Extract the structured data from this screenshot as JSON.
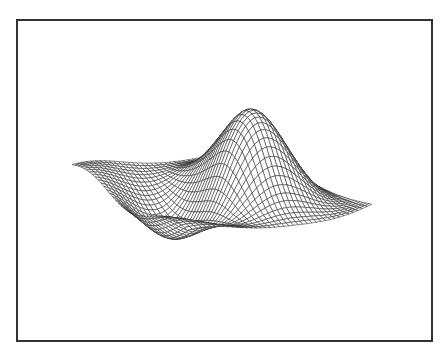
{
  "chart_data": {
    "type": "surface",
    "title": "",
    "xlabel": "",
    "ylabel": "",
    "zlabel": "",
    "axes_visible": false,
    "grid": false,
    "legend": null,
    "render_style": "wireframe-hidden-line",
    "surface": {
      "description": "Damped radial/sinusoidal wave surface z = f(x,y), peaks and troughs alternating",
      "grid_size": [
        40,
        40
      ],
      "x_range": [
        -3.0,
        3.0
      ],
      "y_range": [
        -3.0,
        3.0
      ],
      "function_terms": [
        {
          "kind": "sin_x",
          "amp": 0.9,
          "freq": 1.35,
          "phase": 0.3
        },
        {
          "kind": "cos_y",
          "amp": 0.7,
          "freq": 1.1,
          "phase": 0.0
        },
        {
          "kind": "gauss",
          "amp": 1.1,
          "cx": 0.3,
          "cy": 0.9,
          "s": 0.9
        }
      ],
      "envelope_decay": 0.17
    },
    "view": {
      "azimuth_deg": -32,
      "elevation_deg": 28,
      "screen_center": [
        222,
        188
      ],
      "scale_xy": 25,
      "scale_z": 40
    },
    "colors": {
      "line": "#2a2a2a",
      "face": "#ffffff",
      "frame": "#333333",
      "background": "#ffffff"
    }
  }
}
